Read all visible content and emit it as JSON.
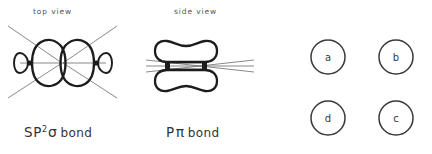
{
  "figure": {
    "title_top_view": "top view",
    "title_side_view": "side view",
    "sigma_label": {
      "base": "SP",
      "superscript": "2",
      "symbol": "σ",
      "word": "bond"
    },
    "pi_label": {
      "base": "P",
      "symbol": "π",
      "word": "bond"
    },
    "choices": [
      {
        "id": "a",
        "label": "a",
        "cx": 328,
        "cy": 57,
        "r": 17
      },
      {
        "id": "b",
        "label": "b",
        "cx": 396,
        "cy": 57,
        "r": 17
      },
      {
        "id": "d",
        "label": "d",
        "cx": 328,
        "cy": 118,
        "r": 17
      },
      {
        "id": "c",
        "label": "c",
        "cx": 396,
        "cy": 118,
        "r": 17
      }
    ],
    "colors": {
      "background": "#ffffff",
      "ink": "#1c1c1c",
      "thin_line": "#6b6b6b",
      "text": "#3a3a3a",
      "muted_text": "#555555"
    }
  }
}
